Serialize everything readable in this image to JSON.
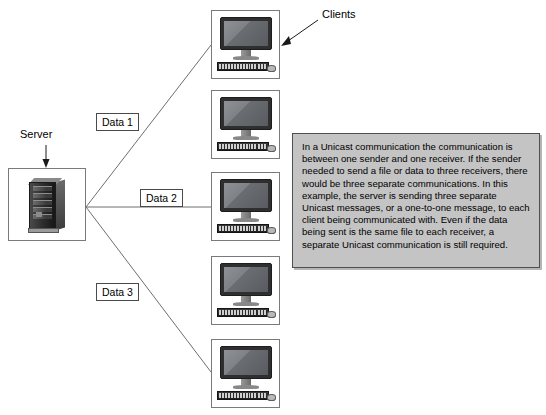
{
  "diagram": {
    "title": "Unicast Communication",
    "background_color": "#ffffff",
    "line_color": "#6e6e6e"
  },
  "server": {
    "label": "Server",
    "icon": "server-tower-icon",
    "pointer": "down-arrow"
  },
  "clients_callout": {
    "label": "Clients",
    "pointer": "diagonal-arrow-down-left"
  },
  "clients": [
    {
      "id": "client-1",
      "icon": "desktop-computer-icon"
    },
    {
      "id": "client-2",
      "icon": "desktop-computer-icon"
    },
    {
      "id": "client-3",
      "icon": "desktop-computer-icon"
    },
    {
      "id": "client-4",
      "icon": "desktop-computer-icon"
    },
    {
      "id": "client-5",
      "icon": "desktop-computer-icon"
    }
  ],
  "data_links": [
    {
      "label": "Data 1",
      "from": "server",
      "to": "client-1"
    },
    {
      "label": "Data 2",
      "from": "server",
      "to": "client-3"
    },
    {
      "label": "Data 3",
      "from": "server",
      "to": "client-5"
    }
  ],
  "description": {
    "text": "In a Unicast communication the communication is between one sender and one receiver.  If the sender needed to send a file or data to three receivers, there would be three separate communications. In this example, the server is sending three separate Unicast messages, or a one-to-one message, to each client being communicated with.  Even if the data being sent is the same file to each receiver, a separate Unicast communication is still required.",
    "background_color": "#c4c4c4",
    "border_color": "#4f4f4f"
  }
}
